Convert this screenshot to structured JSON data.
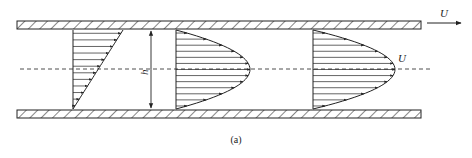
{
  "diagram": {
    "caption": "(a)",
    "labels": {
      "gap_height": "h",
      "max_velocity": "U",
      "wall_velocity": "U"
    },
    "colors": {
      "stroke": "#222222",
      "background": "#ffffff"
    },
    "walls": [
      {
        "name": "top-wall",
        "x": 17,
        "y": 21,
        "width": 404,
        "height": 8,
        "moving": true
      },
      {
        "name": "bottom-wall",
        "x": 17,
        "y": 110,
        "width": 404,
        "height": 8,
        "moving": false
      }
    ],
    "centerline": {
      "y": 69,
      "x1": 20,
      "x2": 433
    },
    "profiles": [
      {
        "name": "linear-couette-profile",
        "type": "linear",
        "base_x": 73,
        "top_y": 30,
        "bottom_y": 109,
        "max_x": 123,
        "arrows": 12
      },
      {
        "name": "parabolic-profile-1",
        "type": "parabolic",
        "base_x": 176,
        "top_y": 30,
        "bottom_y": 109,
        "vertex_x": 250,
        "arrows": 13
      },
      {
        "name": "parabolic-profile-2",
        "type": "parabolic",
        "base_x": 313,
        "top_y": 30,
        "bottom_y": 109,
        "vertex_x": 395,
        "arrows": 13
      }
    ],
    "gap_arrow": {
      "x": 151,
      "y1": 30,
      "y2": 109
    }
  }
}
